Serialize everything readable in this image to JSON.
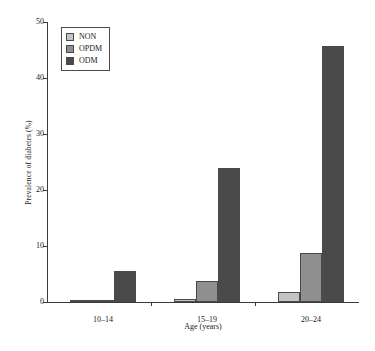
{
  "chart_data": {
    "type": "bar",
    "title": "",
    "subtitle": "",
    "xlabel": "Age (years)",
    "ylabel": "Prevalence of diabetes (%)",
    "categories": [
      "10–14",
      "15–19",
      "20–24"
    ],
    "series": [
      {
        "name": "NON",
        "values": [
          0.3,
          0.5,
          1.7
        ],
        "color": "#c4c4c4"
      },
      {
        "name": "OPDM",
        "values": [
          0.2,
          3.8,
          8.8
        ],
        "color": "#8f8f8f"
      },
      {
        "name": "ODM",
        "values": [
          5.5,
          24.0,
          45.8
        ],
        "color": "#4a4a4a"
      }
    ],
    "ylim": [
      0,
      50
    ],
    "yticks": [
      0,
      10,
      20,
      30,
      40,
      50
    ],
    "ytick_labels": [
      "0",
      "10",
      "20",
      "30",
      "40",
      "50"
    ],
    "grid": false,
    "legend_position": "upper-left",
    "orientation": "vertical"
  },
  "legend": {
    "entries": [
      {
        "label": "NON"
      },
      {
        "label": "OPDM"
      },
      {
        "label": "ODM"
      }
    ]
  },
  "axes": {
    "x_title": "Age (years)",
    "y_title": "Prevalence of diabetes (%)"
  },
  "colors": {
    "non": "#c4c4c4",
    "opdm": "#8f8f8f",
    "odm": "#4a4a4a",
    "axis": "#3a3a3a",
    "background": "#ffffff",
    "text": "#1a1a1a"
  }
}
